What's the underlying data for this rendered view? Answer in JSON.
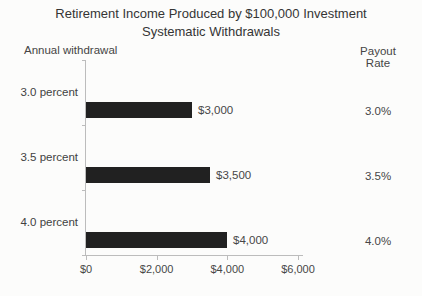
{
  "title": {
    "line1": "Retirement Income Produced by $100,000 Investment",
    "line2": "Systematic Withdrawals"
  },
  "left_header": "Annual withdrawal",
  "right_header": "Payout Rate",
  "chart_data": {
    "type": "bar",
    "orientation": "horizontal",
    "title": "Retirement Income Produced by $100,000 Investment Systematic Withdrawals",
    "categories": [
      "3.0 percent",
      "3.5 percent",
      "4.0 percent"
    ],
    "values": [
      3000,
      3500,
      4000
    ],
    "value_labels": [
      "$3,000",
      "$3,500",
      "$4,000"
    ],
    "payout_rates": [
      "3.0%",
      "3.5%",
      "4.0%"
    ],
    "x_axis": {
      "min": 0,
      "max": 6000,
      "ticks": [
        0,
        2000,
        4000,
        6000
      ],
      "tick_labels": [
        "$0",
        "$2,000",
        "$4,000",
        "$6,000"
      ]
    },
    "legend": "none",
    "grid": false,
    "bar_color": "#212121",
    "axis_color": "#bcbcbc",
    "text_color": "#414141"
  }
}
